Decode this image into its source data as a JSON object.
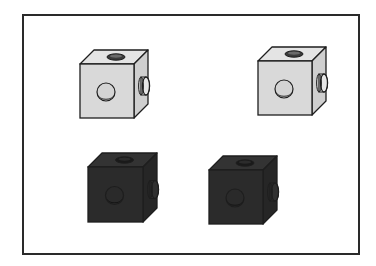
{
  "figure": {
    "frame": {
      "x": 23,
      "y": 15,
      "width": 336,
      "height": 239,
      "stroke": "#2a2a2a"
    },
    "colors": {
      "light_front": "#d9d9d9",
      "light_top": "#e4e4e4",
      "light_side": "#cfcfcf",
      "dark_front": "#2b2b2b",
      "dark_top": "#333333",
      "dark_side": "#262626",
      "edge": "#1e1e1e"
    },
    "cubes": [
      {
        "id": "cube-top-left",
        "shade": "light",
        "x": 80,
        "y": 64,
        "size": 54,
        "dx": 14,
        "dy": 14
      },
      {
        "id": "cube-top-right",
        "shade": "light",
        "x": 258,
        "y": 61,
        "size": 54,
        "dx": 14,
        "dy": 14
      },
      {
        "id": "cube-bottom-left",
        "shade": "dark",
        "x": 88,
        "y": 167,
        "size": 55,
        "dx": 14,
        "dy": 14
      },
      {
        "id": "cube-bottom-right",
        "shade": "dark",
        "x": 209,
        "y": 170,
        "size": 54,
        "dx": 14,
        "dy": 14
      }
    ]
  }
}
